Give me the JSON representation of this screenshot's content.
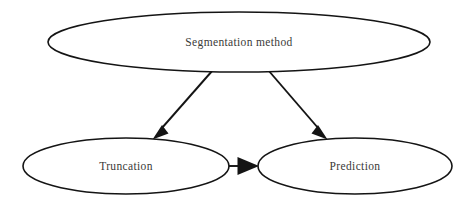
{
  "diagram": {
    "type": "flowchart",
    "background_color": "#ffffff",
    "stroke_color": "#141414",
    "label_color": "#3a3a38",
    "nodes": [
      {
        "id": "segmentation-method",
        "label": "Segmentation method",
        "shape": "ellipse",
        "cx": 239,
        "cy": 42,
        "rx": 191,
        "ry": 30
      },
      {
        "id": "truncation",
        "label": "Truncation",
        "shape": "ellipse",
        "cx": 126,
        "cy": 166,
        "rx": 103,
        "ry": 28
      },
      {
        "id": "prediction",
        "label": "Prediction",
        "shape": "ellipse",
        "cx": 355,
        "cy": 166,
        "rx": 97,
        "ry": 28
      }
    ],
    "edges": [
      {
        "id": "segmentation-to-truncation",
        "from": "segmentation-method",
        "to": "truncation",
        "arrowhead": "filled-triangle"
      },
      {
        "id": "segmentation-to-prediction",
        "from": "segmentation-method",
        "to": "prediction",
        "arrowhead": "filled-triangle"
      },
      {
        "id": "truncation-to-prediction",
        "from": "truncation",
        "to": "prediction",
        "arrowhead": "filled-triangle"
      }
    ]
  }
}
